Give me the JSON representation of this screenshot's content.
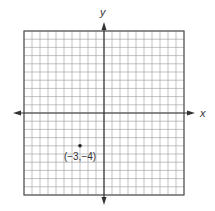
{
  "chart_data": {
    "type": "scatter",
    "title": "",
    "xlabel": "x",
    "ylabel": "y",
    "xlim": [
      -10,
      10
    ],
    "ylim": [
      -10,
      10
    ],
    "grid": true,
    "grid_step": 1,
    "tick_labels": false,
    "points": [
      {
        "x": -3,
        "y": -4,
        "label": "(−3,−4)"
      }
    ]
  },
  "colors": {
    "grid": "#9a9a9a",
    "border": "#555555",
    "axis": "#333333",
    "point": "#222222"
  }
}
